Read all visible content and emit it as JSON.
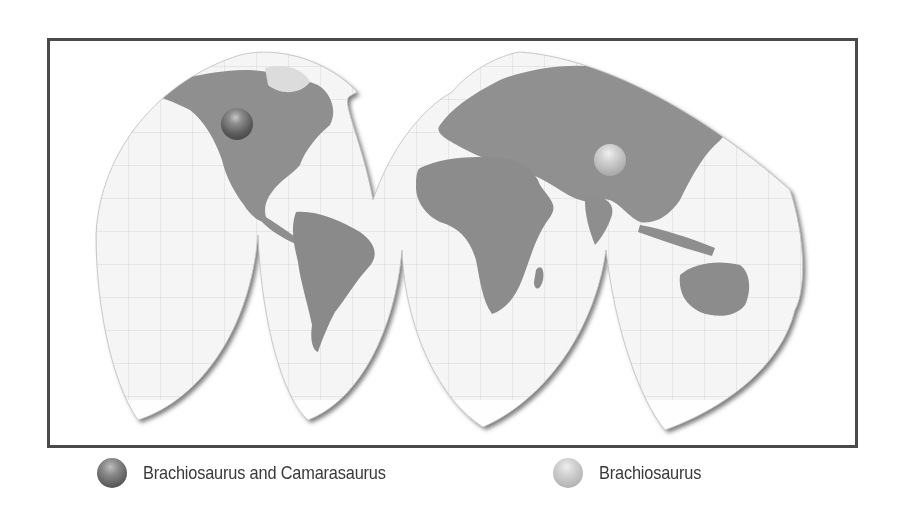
{
  "figure": {
    "type": "world-map",
    "projection": "interrupted-homolosine",
    "style": "grayscale-relief",
    "colors": {
      "frame": "#4a4a4a",
      "ocean": "#f4f4f4",
      "land": "#8e8e8e",
      "graticule": "#cfcfcf",
      "lobe_shadow": "#6a6a6a",
      "marker_dark": "#5c5c5c",
      "marker_light": "#c4c4c4"
    }
  },
  "markers": [
    {
      "id": "north-america",
      "region": "North America (western USA)",
      "legend_ref": 0,
      "style": "dark",
      "x": 237,
      "y": 124
    },
    {
      "id": "asia",
      "region": "Central Asia (China)",
      "legend_ref": 1,
      "style": "light",
      "x": 610,
      "y": 160
    }
  ],
  "legend": {
    "items": [
      {
        "label": "Brachiosaurus and Camarasaurus",
        "symbol": "dark-sphere-icon"
      },
      {
        "label": "Brachiosaurus",
        "symbol": "light-sphere-icon"
      }
    ]
  }
}
